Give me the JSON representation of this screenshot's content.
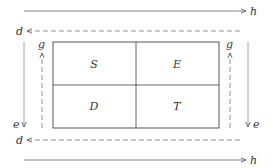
{
  "diagram": {
    "arrows": {
      "top_h": "h",
      "top_d": "d",
      "bottom_d": "d",
      "bottom_h": "h",
      "left_g": "g",
      "left_e": "e",
      "right_g": "g",
      "right_e": "e"
    },
    "grid": {
      "cells": [
        {
          "label": "S"
        },
        {
          "label": "E"
        },
        {
          "label": "D"
        },
        {
          "label": "T"
        }
      ]
    },
    "colors": {
      "line": "#555555",
      "dashed": "#777777",
      "text": "#333333"
    }
  }
}
